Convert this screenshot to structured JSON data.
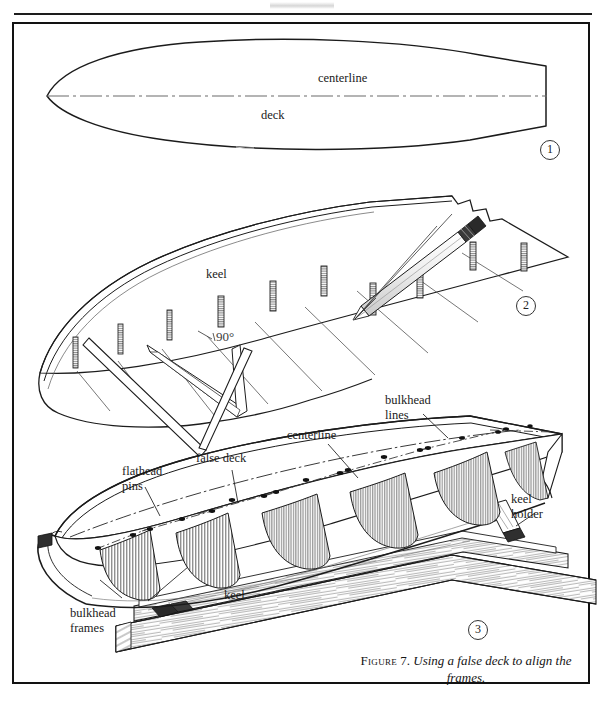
{
  "page": {
    "width": 603,
    "height": 710,
    "background": "#ffffff",
    "ink": "#1a1a1a"
  },
  "figure": {
    "number": "7",
    "caption_label": "Figure",
    "caption_number": "7.",
    "caption_title": "Using a false deck to align the frames.",
    "caption_full": "Figure 7. Using a false deck to align the frames."
  },
  "panels": [
    {
      "id": "panel-1",
      "badge": "1",
      "description": "Top plan view of the deck outline with a centerline",
      "labels": [
        {
          "name": "centerline",
          "text": "centerline",
          "x": 318,
          "y": 78
        },
        {
          "name": "deck",
          "text": "deck",
          "x": 261,
          "y": 115
        }
      ]
    },
    {
      "id": "panel-2",
      "badge": "2",
      "description": "Perspective view of the hull with false deck, pins, a triangle square and a pencil marking a 90 degree line",
      "labels": [
        {
          "name": "keel",
          "text": "keel",
          "x": 206,
          "y": 274
        },
        {
          "name": "angle",
          "text": "90°",
          "x": 200,
          "y": 336
        }
      ]
    },
    {
      "id": "panel-3",
      "badge": "3",
      "description": "Perspective view of the hull on a keel holder showing bulkhead frames, false deck and flathead pins",
      "labels": [
        {
          "name": "bulkhead-lines",
          "text": "bulkhead\nlines",
          "x": 385,
          "y": 398
        },
        {
          "name": "centerline",
          "text": "centerline",
          "x": 287,
          "y": 431
        },
        {
          "name": "false-deck",
          "text": "false deck",
          "x": 196,
          "y": 457
        },
        {
          "name": "flathead-pins",
          "text": "flathead\npins",
          "x": 122,
          "y": 470
        },
        {
          "name": "keel-holder",
          "text": "keel\nholder",
          "x": 509,
          "y": 499
        },
        {
          "name": "keel",
          "text": "keel",
          "x": 224,
          "y": 592
        },
        {
          "name": "bulkhead-frames",
          "text": "bulkhead\nframes",
          "x": 70,
          "y": 610
        }
      ]
    }
  ],
  "badges": {
    "one": "1",
    "two": "2",
    "three": "3"
  },
  "colors": {
    "ink": "#1a1a1a",
    "frame": "#121212",
    "rule": "#1d1d1d",
    "hatch": "#3b3b3b",
    "paper": "#ffffff"
  }
}
